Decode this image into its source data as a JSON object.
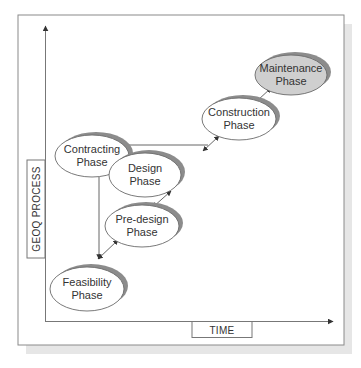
{
  "diagram": {
    "title": "",
    "axes": {
      "y_label": "GEOQ PROCESS",
      "x_label": "TIME"
    },
    "colors": {
      "frame": "#8a8a8a",
      "shadow": "#e4e4e4",
      "node_fill": "#ffffff",
      "node_highlight_fill": "#cfcfcf",
      "node_stroke": "#6a6a6a",
      "node_shadow": "#8c8c8c",
      "edge": "#555555",
      "text": "#333333"
    },
    "nodes": [
      {
        "id": "contracting",
        "line1": "Contracting",
        "line2": "Phase",
        "cx": 92,
        "cy": 156,
        "rx": 37,
        "ry": 21,
        "highlight": false
      },
      {
        "id": "feasibility",
        "line1": "Feasibility",
        "line2": "Phase",
        "cx": 87,
        "cy": 289,
        "rx": 37,
        "ry": 22,
        "highlight": false
      },
      {
        "id": "predesign",
        "line1": "Pre-design",
        "line2": "Phase",
        "cx": 142,
        "cy": 226,
        "rx": 37,
        "ry": 21,
        "highlight": false
      },
      {
        "id": "design",
        "line1": "Design",
        "line2": "Phase",
        "cx": 145,
        "cy": 175,
        "rx": 36,
        "ry": 22,
        "highlight": false
      },
      {
        "id": "construction",
        "line1": "Construction",
        "line2": "Phase",
        "cx": 239,
        "cy": 119,
        "rx": 37,
        "ry": 21,
        "highlight": false
      },
      {
        "id": "maintenance",
        "line1": "Maintenance",
        "line2": "Phase",
        "cx": 291,
        "cy": 75,
        "rx": 36,
        "ry": 20,
        "highlight": true
      }
    ],
    "edges": [
      {
        "from": "contracting",
        "to": "feasibility",
        "type": "single"
      },
      {
        "from": "contracting",
        "to": "design",
        "type": "single"
      },
      {
        "from": "contracting",
        "to": "construction",
        "type": "single"
      },
      {
        "from": "feasibility",
        "to": "predesign",
        "type": "double"
      },
      {
        "from": "predesign",
        "to": "design",
        "type": "double"
      },
      {
        "from": "design",
        "to": "construction",
        "type": "double"
      },
      {
        "from": "construction",
        "to": "maintenance",
        "type": "single"
      }
    ]
  }
}
